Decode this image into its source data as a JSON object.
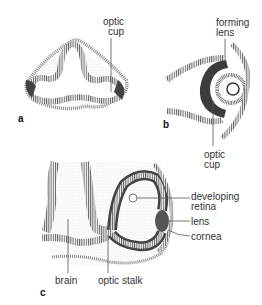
{
  "figure": {
    "panels": [
      {
        "id": "a",
        "label": "a",
        "annotations": [
          {
            "text_lines": [
              "optic",
              "cup"
            ]
          }
        ]
      },
      {
        "id": "b",
        "label": "b",
        "annotations": [
          {
            "text_lines": [
              "forming",
              "lens"
            ]
          },
          {
            "text_lines": [
              "optic",
              "cup"
            ]
          }
        ]
      },
      {
        "id": "c",
        "label": "c",
        "annotations": [
          {
            "text_lines": [
              "developing",
              "retina"
            ]
          },
          {
            "text_lines": [
              "lens"
            ]
          },
          {
            "text_lines": [
              "cornea"
            ]
          },
          {
            "text_lines": [
              "brain"
            ]
          },
          {
            "text_lines": [
              "optic stalk"
            ]
          }
        ]
      }
    ]
  },
  "colors": {
    "tissue_dark": "#3a3a3a",
    "tissue_mid": "#8a8a8a",
    "tissue_light": "#cfcfcf",
    "stipple": "#e6e6e6",
    "text": "#333333"
  }
}
